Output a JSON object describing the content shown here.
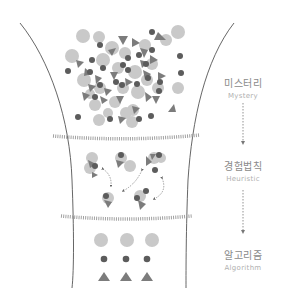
{
  "diagram": {
    "title": "",
    "stages": [
      {
        "id": "mystery",
        "label_ko": "미스터리",
        "label_en": "Mystery"
      },
      {
        "id": "heuristic",
        "label_ko": "경험법칙",
        "label_en": "Heuristic"
      },
      {
        "id": "algorithm",
        "label_ko": "알고리즘",
        "label_en": "Algorithm"
      }
    ],
    "flow": [
      "Mystery",
      "Heuristic",
      "Algorithm"
    ],
    "shapes": {
      "light_circle": "#c9c9c9",
      "dark_dot": "#5c5c5c",
      "triangle": "#7c7c7c"
    },
    "colors": {
      "funnel_line": "#555555",
      "hatch": "#9a9a9a",
      "arrow": "#777777",
      "label_ko": "#8a8a8a",
      "label_en": "#b0b0b0"
    }
  }
}
